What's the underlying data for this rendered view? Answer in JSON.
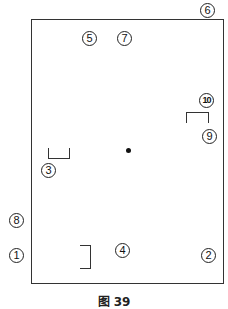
{
  "figure": {
    "caption": "图 39",
    "markers": [
      {
        "id": "1",
        "label": "①"
      },
      {
        "id": "2",
        "label": "②"
      },
      {
        "id": "3",
        "label": "③"
      },
      {
        "id": "4",
        "label": "④"
      },
      {
        "id": "5",
        "label": "⑤"
      },
      {
        "id": "6",
        "label": "⑥"
      },
      {
        "id": "7",
        "label": "⑦"
      },
      {
        "id": "8",
        "label": "⑧"
      },
      {
        "id": "9",
        "label": "⑨"
      },
      {
        "id": "10",
        "label": "⑩"
      }
    ],
    "center_point": "dot",
    "bracket_count": 3
  }
}
